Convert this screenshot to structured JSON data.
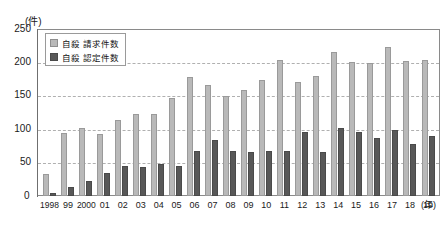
{
  "chart_data": {
    "type": "bar",
    "title": "",
    "xlabel": "(年)",
    "ylabel": "(件)",
    "ylim": [
      0,
      250
    ],
    "yticks": [
      250,
      200,
      150,
      100,
      50,
      0
    ],
    "grid": true,
    "legend_position": "top-left",
    "categories": [
      "1998",
      "99",
      "2000",
      "01",
      "02",
      "03",
      "04",
      "05",
      "06",
      "07",
      "08",
      "09",
      "10",
      "11",
      "12",
      "13",
      "14",
      "15",
      "16",
      "17",
      "18",
      "19"
    ],
    "series": [
      {
        "name": "自殺 請求件数",
        "color": "#b9b9b9",
        "values": [
          33,
          95,
          102,
          94,
          115,
          123,
          123,
          148,
          179,
          167,
          150,
          160,
          174,
          205,
          171,
          180,
          217,
          202,
          201,
          225,
          203,
          205
        ]
      },
      {
        "name": "自殺 認定件数",
        "color": "#585858",
        "values": [
          5,
          14,
          22,
          35,
          45,
          43,
          48,
          45,
          68,
          84,
          68,
          66,
          68,
          68,
          96,
          66,
          102,
          96,
          87,
          100,
          79,
          91
        ]
      }
    ]
  },
  "axis": {
    "unit_label": "(件)",
    "x_unit_label": "(年)",
    "zero_label": "0"
  },
  "legend": {
    "items": [
      {
        "label": "自殺 請求件数"
      },
      {
        "label": "自殺 認定件数"
      }
    ]
  }
}
